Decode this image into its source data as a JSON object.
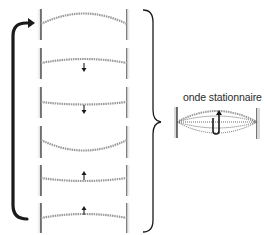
{
  "title": "",
  "standing_wave": {
    "label": "onde stationnaire"
  },
  "panels": [
    {
      "index": 1,
      "shape": "crest-up",
      "arrow": "none"
    },
    {
      "index": 2,
      "shape": "slight-up",
      "arrow": "down"
    },
    {
      "index": 3,
      "shape": "slight-down",
      "arrow": "down"
    },
    {
      "index": 4,
      "shape": "trough-down",
      "arrow": "none"
    },
    {
      "index": 5,
      "shape": "slight-down",
      "arrow": "up"
    },
    {
      "index": 6,
      "shape": "slight-up",
      "arrow": "up"
    }
  ],
  "colors": {
    "line": "#2b2b2b",
    "string": "#9a9a9a",
    "post_shade": "#d4d4d4",
    "arrow": "#1a1a1a"
  },
  "cycle_arrow": {
    "direction": "bottom-to-top"
  }
}
